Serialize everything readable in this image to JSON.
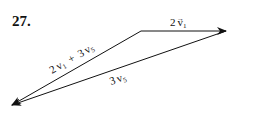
{
  "problem": {
    "number": "27."
  },
  "vectors": [
    {
      "id": "v1",
      "coef": "2",
      "name": "v",
      "subscript": "1",
      "label": "2v₁"
    },
    {
      "id": "v5",
      "coef": "3",
      "name": "v",
      "subscript": "5",
      "label": "3v₅"
    },
    {
      "id": "sum",
      "label": "2v₁ + 3v₅",
      "part1": {
        "coef": "2",
        "name": "v",
        "subscript": "1"
      },
      "plus": "+",
      "part2": {
        "coef": "3",
        "name": "v",
        "subscript": "5"
      }
    }
  ],
  "colors": {
    "line": "#111111",
    "background": "#ffffff"
  }
}
